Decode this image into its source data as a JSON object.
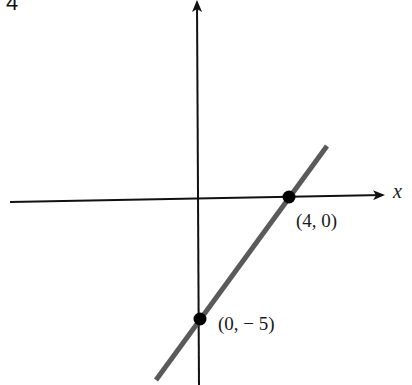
{
  "page_number": "4",
  "axes": {
    "x_label": "x",
    "y_label": ""
  },
  "points": [
    {
      "label": "(4, 0)",
      "x": 4,
      "y": 0
    },
    {
      "label": "(0, − 5)",
      "x": 0,
      "y": -5
    }
  ],
  "line": {
    "description": "Line through (4, 0) and (0, -5)",
    "slope": 1.25,
    "y_intercept": -5,
    "x_intercept": 4,
    "color": "#5a5a5a"
  },
  "colors": {
    "axis": "#111111",
    "line": "#5a5a5a",
    "point": "#000000",
    "background": "#ffffff"
  }
}
